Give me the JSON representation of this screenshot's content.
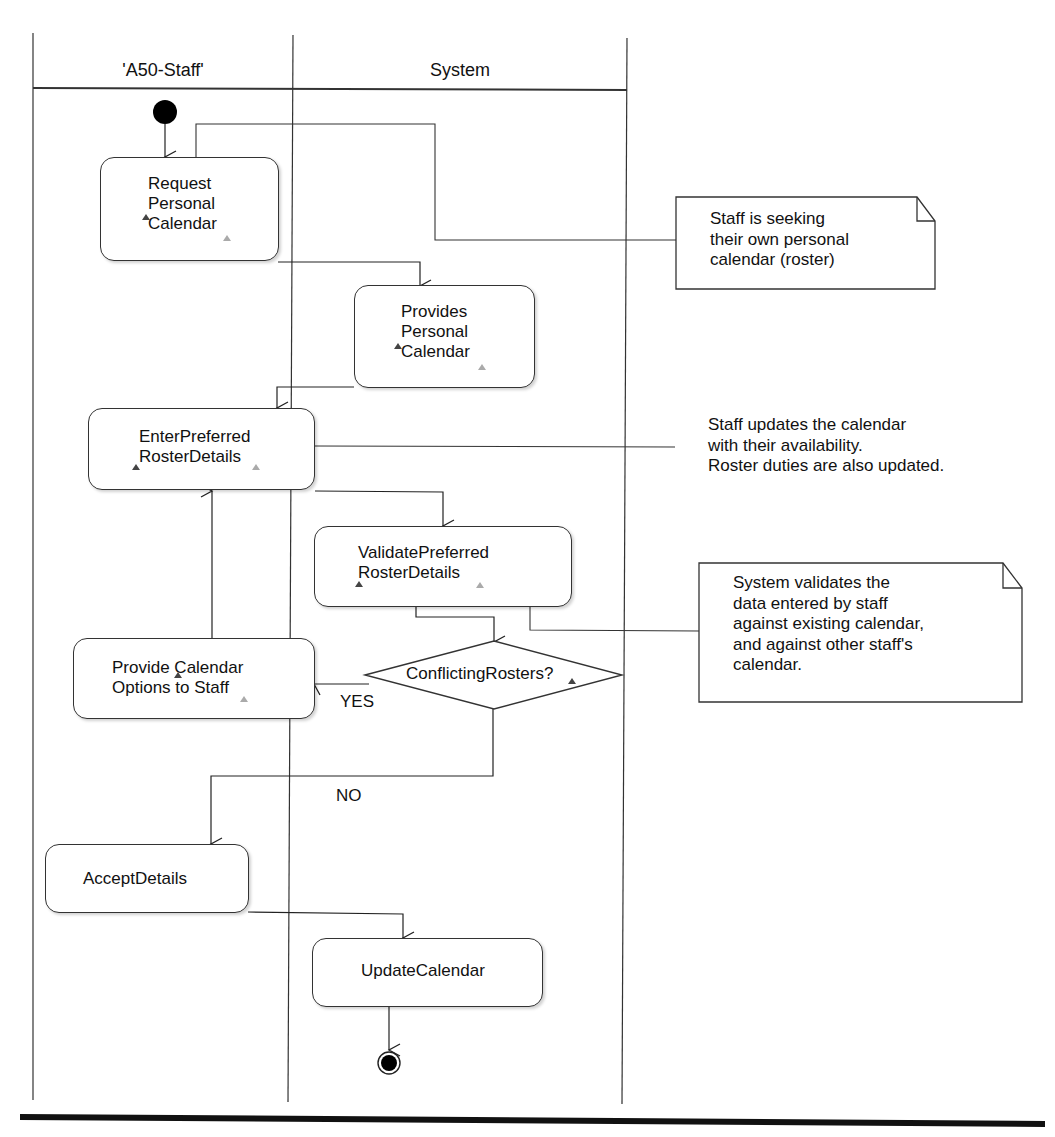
{
  "diagram": {
    "type": "UML activity diagram with swimlanes",
    "swimlanes": [
      {
        "id": "staff",
        "title": "'A50-Staff'"
      },
      {
        "id": "system",
        "title": "System"
      }
    ],
    "activities": {
      "request_personal_calendar": {
        "lines": [
          "Request",
          "Personal",
          "Calendar"
        ],
        "lane": "staff"
      },
      "provides_personal_calendar": {
        "lines": [
          "Provides",
          "Personal",
          "Calendar"
        ],
        "lane": "system"
      },
      "enter_preferred_roster_details": {
        "lines": [
          "EnterPreferred",
          "RosterDetails"
        ],
        "lane": "staff"
      },
      "validate_preferred_roster_details": {
        "lines": [
          "ValidatePreferred",
          "RosterDetails"
        ],
        "lane": "system"
      },
      "provide_calendar_options": {
        "lines": [
          "Provide Calendar",
          "Options to Staff"
        ],
        "lane": "staff"
      },
      "accept_details": {
        "lines": [
          "AcceptDetails"
        ],
        "lane": "staff"
      },
      "update_calendar": {
        "lines": [
          "UpdateCalendar"
        ],
        "lane": "system"
      }
    },
    "decision": {
      "label": "ConflictingRosters?",
      "yes_label": "YES",
      "no_label": "NO"
    },
    "notes": {
      "note1": {
        "text": "Staff is seeking\ntheir own personal\ncalendar (roster)",
        "boxed": true
      },
      "note2": {
        "text": "Staff updates the calendar\nwith their availability.\nRoster duties are also updated.",
        "boxed": false
      },
      "note3": {
        "text": "System validates the\ndata entered by staff\nagainst existing calendar,\nand against other staff's\ncalendar.",
        "boxed": true
      }
    },
    "flows": [
      "initial -> Request Personal Calendar",
      "Request Personal Calendar -> Provides Personal Calendar",
      "Provides Personal Calendar -> EnterPreferred RosterDetails",
      "EnterPreferred RosterDetails -> ValidatePreferred RosterDetails",
      "ValidatePreferred RosterDetails -> ConflictingRosters?",
      "ConflictingRosters? [YES] -> Provide Calendar Options to Staff",
      "Provide Calendar Options to Staff -> EnterPreferred RosterDetails",
      "ConflictingRosters? [NO] -> AcceptDetails",
      "AcceptDetails -> UpdateCalendar",
      "UpdateCalendar -> final"
    ]
  }
}
